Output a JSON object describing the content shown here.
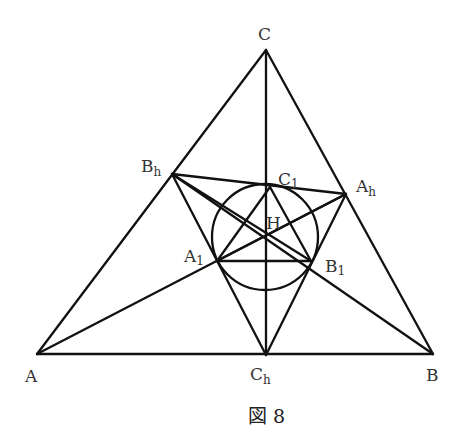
{
  "diagram": {
    "caption": "図 8",
    "points": {
      "A": {
        "label": "A",
        "sub": ""
      },
      "B": {
        "label": "B",
        "sub": ""
      },
      "C": {
        "label": "C",
        "sub": ""
      },
      "Ah": {
        "label": "A",
        "sub": "h"
      },
      "Bh": {
        "label": "B",
        "sub": "h"
      },
      "Ch": {
        "label": "C",
        "sub": "h"
      },
      "A1": {
        "label": "A",
        "sub": "1"
      },
      "B1": {
        "label": "B",
        "sub": "1"
      },
      "C1": {
        "label": "C",
        "sub": "1"
      },
      "H": {
        "label": "H",
        "sub": ""
      }
    },
    "segments": [
      [
        "A",
        "B"
      ],
      [
        "B",
        "C"
      ],
      [
        "C",
        "A"
      ],
      [
        "C",
        "Ch"
      ],
      [
        "A",
        "Ah"
      ],
      [
        "B",
        "Bh"
      ],
      [
        "Ah",
        "Bh"
      ],
      [
        "Bh",
        "Ch"
      ],
      [
        "Ch",
        "Ah"
      ],
      [
        "A1",
        "B1"
      ],
      [
        "B1",
        "C1"
      ],
      [
        "C1",
        "A1"
      ],
      [
        "Bh",
        "B1"
      ],
      [
        "Ah",
        "A1"
      ]
    ],
    "circle": {
      "name": "incircle",
      "through": [
        "A1",
        "B1",
        "C1"
      ]
    }
  }
}
